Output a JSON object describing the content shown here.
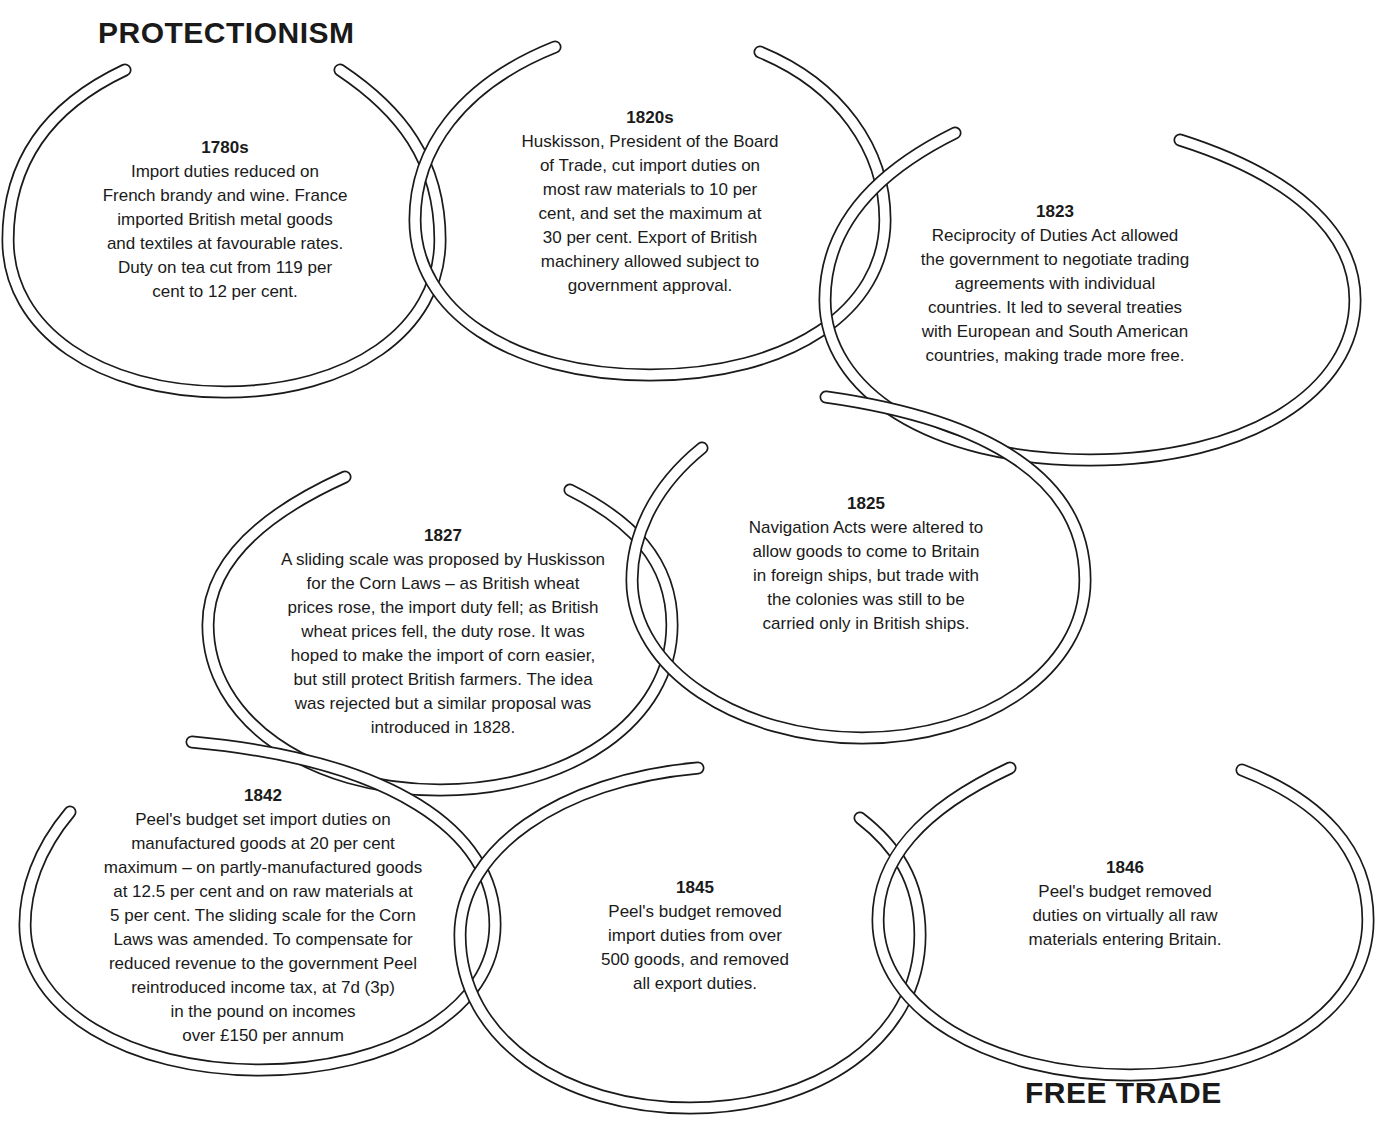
{
  "titles": {
    "start": "PROTECTIONISM",
    "end": "FREE TRADE"
  },
  "style": {
    "line_color": "#1a1a1a",
    "background": "#ffffff"
  },
  "events": [
    {
      "year": "1780s",
      "lines": [
        "Import duties reduced on",
        "French brandy and wine. France",
        "imported British metal goods",
        "and textiles at favourable rates.",
        "Duty on tea cut from 119 per",
        "cent to 12 per cent."
      ]
    },
    {
      "year": "1820s",
      "lines": [
        "Huskisson, President of the Board",
        "of Trade, cut import duties on",
        "most raw materials to 10 per",
        "cent, and set the maximum at",
        "30 per cent. Export of British",
        "machinery allowed subject to",
        "government approval."
      ]
    },
    {
      "year": "1823",
      "lines": [
        "Reciprocity of Duties Act allowed",
        "the government to negotiate trading",
        "agreements with individual",
        "countries. It led to several treaties",
        "with European and South American",
        "countries, making trade more free."
      ]
    },
    {
      "year": "1825",
      "lines": [
        "Navigation Acts were altered to",
        "allow goods to come to Britain",
        "in foreign ships, but trade with",
        "the colonies was still to be",
        "carried only in British ships."
      ]
    },
    {
      "year": "1827",
      "lines": [
        "A sliding scale was proposed by Huskisson",
        "for the Corn Laws – as British wheat",
        "prices rose, the import duty fell; as British",
        "wheat prices fell, the duty rose. It was",
        "hoped to make the import of corn easier,",
        "but still protect British farmers. The idea",
        "was rejected but a similar proposal was",
        "introduced in 1828."
      ]
    },
    {
      "year": "1842",
      "lines": [
        "Peel's budget set import duties on",
        "manufactured goods at 20 per cent",
        "maximum – on partly-manufactured goods",
        "at 12.5 per cent and on raw materials at",
        "5 per cent. The sliding scale for the Corn",
        "Laws was amended. To compensate for",
        "reduced revenue to the government Peel",
        "reintroduced income tax, at 7d (3p)",
        "in the pound on incomes",
        "over £150 per annum"
      ]
    },
    {
      "year": "1845",
      "lines": [
        "Peel's budget removed",
        "import duties from over",
        "500 goods, and removed",
        "all export duties."
      ]
    },
    {
      "year": "1846",
      "lines": [
        "Peel's budget removed",
        "duties on virtually all raw",
        "materials entering Britain."
      ]
    }
  ]
}
